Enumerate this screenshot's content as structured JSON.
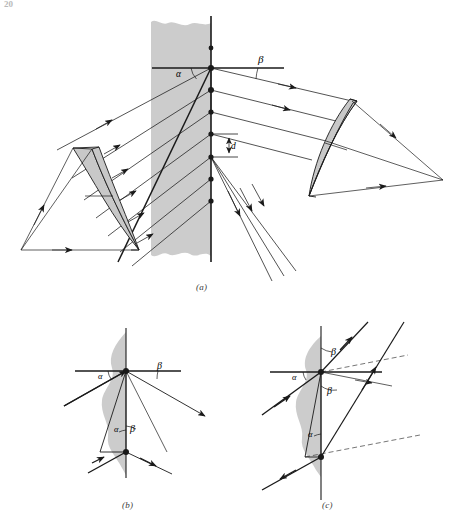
{
  "page": {
    "number": "20",
    "background_color": "#ffffff",
    "ink_color": "#1a1a1a",
    "medium_fill": "#cccccc",
    "lens_fill": "#c8c8c8",
    "width": 457,
    "height": 525
  },
  "figure": {
    "panels": [
      {
        "id": "a",
        "caption": "(a)",
        "description": "plane-parallel plate with collimated beam, collimating lens at left and focusing lens at right",
        "labels": {
          "alpha": "α",
          "beta": "β",
          "thickness": "d"
        }
      },
      {
        "id": "b",
        "caption": "(b)",
        "description": "single ray refracted and internally reflected inside plate, angles alpha and beta marked",
        "labels": {
          "alpha_top": "α",
          "beta_top": "β",
          "alpha_bottom": "α",
          "beta_bottom": "β"
        }
      },
      {
        "id": "c",
        "caption": "(c)",
        "description": "ray entering plate from lower left with two emergent parallel beams, angles alpha and two beta marked",
        "labels": {
          "alpha_top": "α",
          "beta_upper": "β",
          "beta_lower": "β",
          "alpha_bottom": "α"
        }
      }
    ]
  }
}
